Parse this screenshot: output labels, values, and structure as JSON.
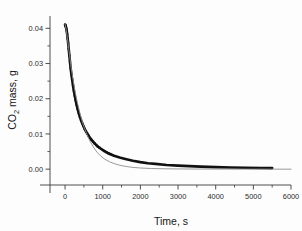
{
  "figure": {
    "background": "#fdfdfd",
    "plot_area": {
      "left": 50,
      "right": 291,
      "top": 16,
      "bottom": 185
    }
  },
  "chart_data": {
    "type": "line",
    "title": "",
    "xlabel": "Time, s",
    "ylabel_main": "CO",
    "ylabel_sub": "2",
    "ylabel_rest": " mass, g",
    "ylabel_full": "CO2 mass, g",
    "xlim": [
      -400,
      6000
    ],
    "ylim": [
      -0.0045,
      0.0435
    ],
    "xticks": [
      0,
      1000,
      2000,
      3000,
      4000,
      5000,
      6000
    ],
    "xtick_labels": [
      "0",
      "1000",
      "2000",
      "3000",
      "4000",
      "5000",
      "6000"
    ],
    "yticks": [
      0.0,
      0.01,
      0.02,
      0.03,
      0.04
    ],
    "ytick_labels": [
      "0.00",
      "0.01",
      "0.02",
      "0.03",
      "0.04"
    ],
    "minor_xticks": [
      500,
      1500,
      2500,
      3500,
      4500,
      5500
    ],
    "minor_yticks": [
      0.005,
      0.015,
      0.025,
      0.035
    ],
    "grid": false,
    "legend": false,
    "frame": "open-left-bottom",
    "tick_direction": "out",
    "series": [
      {
        "name": "experimental",
        "style": "markers-dense-square",
        "color": "#111111",
        "linewidth": 2.6,
        "marker_size": 2.2,
        "x": [
          0,
          20,
          40,
          60,
          80,
          100,
          120,
          140,
          160,
          180,
          200,
          230,
          260,
          300,
          340,
          380,
          430,
          480,
          540,
          600,
          680,
          760,
          850,
          950,
          1050,
          1150,
          1300,
          1450,
          1600,
          1800,
          2000,
          2200,
          2400,
          2700,
          3000,
          3300,
          3600,
          4000,
          4400,
          4800,
          5200,
          5500
        ],
        "y": [
          0.041,
          0.0405,
          0.0396,
          0.038,
          0.036,
          0.0338,
          0.0316,
          0.0295,
          0.0276,
          0.026,
          0.0245,
          0.0225,
          0.0207,
          0.0186,
          0.0168,
          0.0153,
          0.0137,
          0.0124,
          0.011,
          0.0099,
          0.0086,
          0.0076,
          0.0066,
          0.0058,
          0.0051,
          0.0045,
          0.0038,
          0.0033,
          0.0029,
          0.0024,
          0.002,
          0.0017,
          0.0015,
          0.0012,
          0.001,
          0.00085,
          0.00072,
          0.00058,
          0.00048,
          0.0004,
          0.00034,
          0.0003
        ]
      },
      {
        "name": "model-fit",
        "style": "thin-line",
        "color": "#8d8d8d",
        "linewidth": 0.9,
        "x": [
          0,
          30,
          60,
          100,
          150,
          200,
          260,
          320,
          400,
          480,
          560,
          650,
          750,
          850,
          950,
          1060,
          1180,
          1300,
          1450,
          1600,
          1800,
          2000,
          2300,
          2600,
          3000,
          3400,
          3900,
          4400,
          5000,
          5600,
          6000
        ],
        "y": [
          0.0412,
          0.0396,
          0.0374,
          0.034,
          0.0298,
          0.0262,
          0.0224,
          0.0192,
          0.0156,
          0.0127,
          0.0104,
          0.0082,
          0.0063,
          0.0048,
          0.0037,
          0.0028,
          0.0021,
          0.0016,
          0.0011,
          0.0008,
          0.0005,
          0.00033,
          0.00018,
          0.00011,
          6e-05,
          4e-05,
          2e-05,
          1e-05,
          1e-05,
          0.0,
          0.0
        ]
      }
    ]
  }
}
